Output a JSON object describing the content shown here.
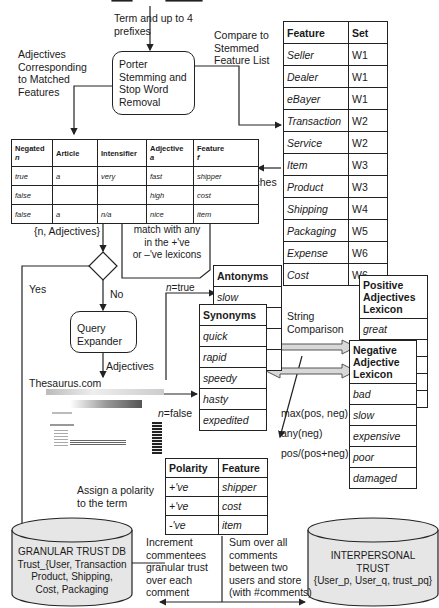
{
  "labels": {
    "term_prefixes": [
      "Term and up to 4",
      "prefixes"
    ],
    "compare": [
      "Compare to",
      "Stemmed",
      "Feature List"
    ],
    "adj_corresponding": [
      "Adjectives",
      "Corresponding",
      "to Matched",
      "Features"
    ],
    "matches": "Matches",
    "n_adjectives": "{n, Adjectives}",
    "yes": "Yes",
    "no": "No",
    "adjectives": "Adjectives",
    "thesaurus": "Thesaurus.com",
    "n_true": "n=true",
    "n_false": "n=false",
    "string_comparison": [
      "String",
      "Comparison"
    ],
    "max": "max(pos, neg)",
    "any": "any(neg)",
    "ratio": "pos/(pos+neg)",
    "assign": [
      "Assign a polarity",
      "to the term"
    ],
    "increment": [
      "Increment",
      "commentees",
      "granular trust",
      "over each",
      "comment"
    ],
    "sum": [
      "Sum over all",
      "comments",
      "between two",
      "users and store",
      "(with #comments)"
    ]
  },
  "callout": [
    "match with any",
    "in the +'ve",
    "or –'ve lexicons"
  ],
  "porter_box": [
    "Porter",
    "Stemming and",
    "Stop Word",
    "Removal"
  ],
  "query_box": [
    "Query",
    "Expander"
  ],
  "feature_table": {
    "headers": [
      "Feature",
      "Set"
    ],
    "rows": [
      [
        "Seller",
        "W1"
      ],
      [
        "Dealer",
        "W1"
      ],
      [
        "eBayer",
        "W1"
      ],
      [
        "Transaction",
        "W2"
      ],
      [
        "Service",
        "W2"
      ],
      [
        "Item",
        "W3"
      ],
      [
        "Product",
        "W3"
      ],
      [
        "Shipping",
        "W4"
      ],
      [
        "Packaging",
        "W5"
      ],
      [
        "Expense",
        "W6"
      ],
      [
        "Cost",
        "W6"
      ]
    ]
  },
  "adjective_table": {
    "headers": [
      [
        "Negated",
        "n"
      ],
      [
        "Article",
        ""
      ],
      [
        "Intensifier",
        ""
      ],
      [
        "Adjective",
        "a"
      ],
      [
        "Feature",
        "f"
      ]
    ],
    "rows": [
      [
        "true",
        "a",
        "very",
        "fast",
        "shipper"
      ],
      [
        "false",
        "",
        "",
        "high",
        "cost"
      ],
      [
        "false",
        "a",
        "n/a",
        "nice",
        "item"
      ]
    ]
  },
  "antonyms": {
    "header": "Antonyms",
    "rows": [
      "slow",
      "",
      "",
      ""
    ]
  },
  "synonyms": {
    "header": "Synonyms",
    "rows": [
      "quick",
      "rapid",
      "speedy",
      "hasty",
      "expedited"
    ]
  },
  "positive_lexicon": {
    "header": [
      "Positive",
      "Adjectives",
      "Lexicon"
    ],
    "rows": [
      "great",
      "",
      "",
      "",
      ""
    ]
  },
  "negative_lexicon": {
    "header": [
      "Negative",
      "Adjective",
      "Lexicon"
    ],
    "rows": [
      "bad",
      "slow",
      "expensive",
      "poor",
      "damaged"
    ]
  },
  "polarity_table": {
    "headers": [
      "Polarity",
      "Feature"
    ],
    "rows": [
      [
        "+'ve",
        "shipper"
      ],
      [
        "+'ve",
        "cost"
      ],
      [
        "-'ve",
        "item"
      ]
    ]
  },
  "granular_db": [
    "GRANULAR TRUST DB",
    "Trust_{User, Transaction",
    "Product, Shipping,",
    "Cost, Packaging"
  ],
  "interpersonal_db": [
    "INTERPERSONAL",
    "TRUST",
    "{User_p, User_q, trust_pq}"
  ]
}
